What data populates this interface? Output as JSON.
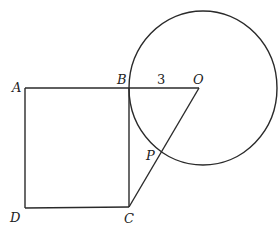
{
  "diagram": {
    "points": [
      {
        "id": "A",
        "label": "A"
      },
      {
        "id": "B",
        "label": "B"
      },
      {
        "id": "C",
        "label": "C"
      },
      {
        "id": "D",
        "label": "D"
      },
      {
        "id": "O",
        "label": "O"
      },
      {
        "id": "P",
        "label": "P"
      }
    ],
    "segments": [
      {
        "from": "A",
        "to": "B"
      },
      {
        "from": "B",
        "to": "C"
      },
      {
        "from": "C",
        "to": "D"
      },
      {
        "from": "D",
        "to": "A"
      },
      {
        "from": "B",
        "to": "O"
      },
      {
        "from": "O",
        "to": "C"
      }
    ],
    "circle": {
      "center": "O",
      "through": "B"
    },
    "measurements": [
      {
        "segment": "BO",
        "label": "3"
      }
    ]
  }
}
